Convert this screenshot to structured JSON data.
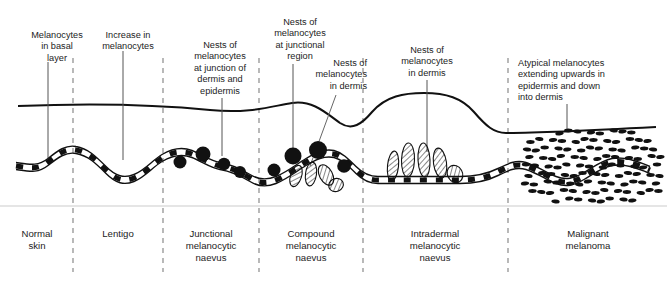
{
  "figure": {
    "ink_color": "#111111",
    "divider_color": "#8a8a8a",
    "baseline_color": "#d8d8d8"
  },
  "annotations": [
    {
      "name": "melanocytes-in-basal-layer",
      "text": "Melanocytes\nin basal\nlayer",
      "x": 18,
      "y": 30,
      "width": 78,
      "align": "center",
      "leader_x": 48,
      "leader_y1": 62,
      "leader_y2": 158
    },
    {
      "name": "increase-in-melanocytes",
      "text": "Increase in\nmelanocytes",
      "x": 85,
      "y": 30,
      "width": 86,
      "align": "center",
      "leader_x": 123,
      "leader_y1": 51,
      "leader_y2": 160
    },
    {
      "name": "nests-at-junction-of-dermis-and-epidermis",
      "text": "Nests of\nmelanocytes\nat junction of\ndermis and\nepidermis",
      "x": 176,
      "y": 40,
      "width": 88,
      "align": "center",
      "leader_x": 222,
      "leader_y1": 98,
      "leader_y2": 156
    },
    {
      "name": "nests-at-junctional-region",
      "text": "Nests of\nmelanocytes\nat junctional\nregion",
      "x": 258,
      "y": 17,
      "width": 84,
      "align": "center",
      "leader_x": 293,
      "leader_y1": 64,
      "leader_y2": 148
    },
    {
      "name": "nests-of-melanocytes-in-dermis-compound",
      "text": "Nests of\nmelanocytes\nin dermis",
      "x": 297,
      "y": 58,
      "width": 70,
      "align": "right",
      "leader_x": 336,
      "leader_y1": 95,
      "leader_y2": 166
    },
    {
      "name": "nests-of-melanocytes-in-dermis-intradermal",
      "text": "Nests of\nmelanocytes\nin dermis",
      "x": 385,
      "y": 45,
      "width": 84,
      "align": "center",
      "leader_x": 427,
      "leader_y1": 80,
      "leader_y2": 152
    },
    {
      "name": "atypical-melanocytes-extending",
      "text": "Atypical melanocytes\nextending upwards in\nepidermis and down\ninto dermis",
      "x": 518,
      "y": 58,
      "width": 132,
      "align": "left",
      "leader_x": 567,
      "leader_y1": 104,
      "leader_y2": 132
    }
  ],
  "sections": [
    {
      "name": "normal-skin",
      "label": "Normal\nskin",
      "center_x": 37,
      "x1": 0,
      "x2": 73
    },
    {
      "name": "lentigo",
      "label": "Lentigo",
      "center_x": 118,
      "x1": 73,
      "x2": 163
    },
    {
      "name": "junctional-melanocytic-naevus",
      "label": "Junctional\nmelanocytic\nnaevus",
      "center_x": 211,
      "x1": 163,
      "x2": 259
    },
    {
      "name": "compound-melanocytic-naevus",
      "label": "Compound\nmelanocytic\nnaevus",
      "center_x": 311,
      "x1": 259,
      "x2": 363
    },
    {
      "name": "intradermal-melanocytic-naevus",
      "label": "Intradermal\nmelanocytic\nnaevus",
      "center_x": 435,
      "x1": 363,
      "x2": 508
    },
    {
      "name": "malignant-melanoma",
      "label": "Malignant\nmelanoma",
      "center_x": 588,
      "x1": 508,
      "x2": 667
    }
  ],
  "dividers_x": [
    73,
    163,
    259,
    363,
    508
  ],
  "divider_top_y": 58,
  "divider_bottom_y": 272,
  "separator_y": 206,
  "skin_surface_path": "M 18,106 C 90,103 150,104 210,110 C 250,114 272,106 292,103 C 312,100 325,112 340,123 C 352,131 362,124 372,112 C 386,96 404,93 424,93 C 446,93 462,98 474,112 C 486,126 494,133 506,133 C 530,133 600,130 656,127",
  "basal_layer": {
    "name": "dermo-epidermal-junction",
    "path": "M 16,166 C 30,168 38,170 48,162 C 58,154 66,148 76,150 C 88,152 96,160 106,170 C 116,180 124,182 134,178 C 146,173 152,164 162,158 C 172,152 182,150 192,154 C 202,158 210,164 220,166 C 232,168 240,172 250,178 C 258,183 266,184 276,180 C 288,175 296,168 306,162 C 316,156 324,152 334,154 C 342,156 348,162 356,170 C 362,176 368,180 378,180 C 392,180 404,180 418,180 C 432,180 446,180 460,180 C 474,180 486,178 498,172 C 508,167 516,163 526,166 C 538,170 546,176 556,180 C 566,184 574,182 584,176 C 594,170 602,164 612,162 C 624,160 636,164 650,170"
  },
  "junctional_nests": [
    {
      "cx": 180,
      "cy": 162,
      "r": 6.5
    },
    {
      "cx": 203,
      "cy": 154,
      "r": 7.5
    },
    {
      "cx": 224,
      "cy": 164,
      "r": 6.2
    },
    {
      "cx": 240,
      "cy": 172,
      "r": 6.0
    },
    {
      "cx": 274,
      "cy": 170,
      "r": 6.5
    },
    {
      "cx": 293,
      "cy": 156,
      "r": 8.5
    },
    {
      "cx": 318,
      "cy": 150,
      "r": 9.0
    },
    {
      "cx": 344,
      "cy": 166,
      "r": 6.8
    }
  ],
  "dermal_nests_compound": [
    {
      "cx": 296,
      "cy": 176,
      "rx": 5.5,
      "ry": 11,
      "rot": 18
    },
    {
      "cx": 311,
      "cy": 174,
      "rx": 5.5,
      "ry": 12,
      "rot": 8
    },
    {
      "cx": 326,
      "cy": 175,
      "rx": 6.5,
      "ry": 11,
      "rot": -28
    },
    {
      "cx": 336,
      "cy": 185,
      "rx": 7.5,
      "ry": 6.5,
      "rot": -22
    }
  ],
  "dermal_nests_intradermal": [
    {
      "cx": 393,
      "cy": 166,
      "rx": 5.5,
      "ry": 15,
      "rot": 6
    },
    {
      "cx": 408,
      "cy": 160,
      "rx": 6.5,
      "ry": 17,
      "rot": 2
    },
    {
      "cx": 424,
      "cy": 160,
      "rx": 6.0,
      "ry": 17,
      "rot": -3
    },
    {
      "cx": 440,
      "cy": 163,
      "rx": 6.5,
      "ry": 15,
      "rot": -8
    },
    {
      "cx": 455,
      "cy": 174,
      "rx": 7.5,
      "ry": 9,
      "rot": -30
    }
  ],
  "melanoma_field": {
    "name": "atypical-melanocyte-field",
    "x_start": 525,
    "x_end": 655,
    "y_start": 132,
    "y_end": 200,
    "dot_rx": 4.2,
    "dot_ry": 1.9,
    "cols": 13,
    "rows": 9
  },
  "counts": {
    "sections": 6,
    "annotations": 7,
    "dividers": 5
  }
}
